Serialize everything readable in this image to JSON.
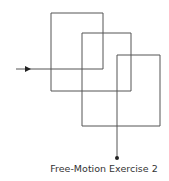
{
  "caption": "Free-Motion Exercise 2",
  "colors": {
    "line": "#555555",
    "text": "#333333",
    "background": "#ffffff"
  },
  "path": {
    "start": [
      16,
      69
    ],
    "points": [
      [
        16,
        69
      ],
      [
        103,
        69
      ],
      [
        103,
        13
      ],
      [
        51,
        13
      ],
      [
        51,
        91
      ],
      [
        131,
        91
      ],
      [
        131,
        33
      ],
      [
        82,
        33
      ],
      [
        82,
        126
      ],
      [
        160,
        126
      ],
      [
        160,
        55
      ],
      [
        117,
        55
      ],
      [
        117,
        158
      ]
    ],
    "arrowhead": {
      "at": [
        30,
        69
      ],
      "direction": "right",
      "icon": "arrowhead-icon"
    },
    "end_marker": {
      "at": [
        117,
        158
      ],
      "icon": "end-dot-icon"
    }
  }
}
